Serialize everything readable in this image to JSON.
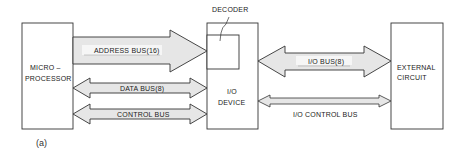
{
  "diagram": {
    "caption": "(a)",
    "blocks": {
      "microprocessor": {
        "line1": "MICRO –",
        "line2": "PROCESSOR"
      },
      "io_device": {
        "line1": "I/O",
        "line2": "DEVICE"
      },
      "decoder": {
        "label": "DECODER"
      },
      "external_circuit": {
        "line1": "EXTERNAL",
        "line2": "CIRCUIT"
      }
    },
    "buses": {
      "address_bus": {
        "label": "ADDRESS BUS(16)",
        "direction": "microprocessor-to-io"
      },
      "data_bus": {
        "label": "DATA BUS(8)",
        "direction": "bidirectional"
      },
      "control_bus": {
        "label": "CONTROL BUS",
        "direction": "bidirectional"
      },
      "io_bus": {
        "label": "I/O BUS(8)",
        "direction": "bidirectional"
      },
      "io_control_bus": {
        "label": "I/O CONTROL BUS",
        "direction": "bidirectional"
      }
    },
    "colors": {
      "stroke": "#333333",
      "arrow_fill": "#e6e6e6",
      "label_band": "#f4f4f4"
    }
  }
}
